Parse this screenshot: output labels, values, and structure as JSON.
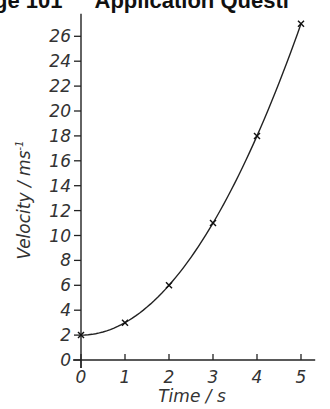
{
  "header": {
    "left": "ge 101",
    "right": "Application Questi"
  },
  "chart_data": {
    "type": "line",
    "title": "",
    "xlabel": "Time / s",
    "ylabel": "Velocity / ms",
    "ylabel_superscript": "-1",
    "x": [
      0,
      1,
      2,
      3,
      4,
      5
    ],
    "series": [
      {
        "name": "Velocity",
        "values": [
          2,
          3,
          6,
          11,
          18,
          27
        ],
        "marker": "x",
        "smooth_curve": true
      }
    ],
    "xticks": [
      0,
      1,
      2,
      3,
      4,
      5
    ],
    "yticks": [
      0,
      2,
      4,
      6,
      8,
      10,
      12,
      14,
      16,
      18,
      20,
      22,
      24,
      26
    ],
    "xlim": [
      0,
      5.3
    ],
    "ylim": [
      0,
      27.5
    ],
    "grid": false,
    "legend": "none"
  }
}
